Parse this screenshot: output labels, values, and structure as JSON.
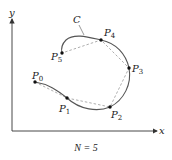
{
  "diagram": {
    "axes": {
      "x_label": "x",
      "y_label": "y",
      "color": "#333333"
    },
    "curve": {
      "label": "C",
      "color": "#555555"
    },
    "polyline": {
      "style": "dashed",
      "color": "#999999"
    },
    "points": [
      {
        "name": "P",
        "sub": "0",
        "x": 35,
        "y": 82
      },
      {
        "name": "P",
        "sub": "1",
        "x": 67,
        "y": 98
      },
      {
        "name": "P",
        "sub": "2",
        "x": 110,
        "y": 107
      },
      {
        "name": "P",
        "sub": "3",
        "x": 129,
        "y": 68
      },
      {
        "name": "P",
        "sub": "4",
        "x": 101,
        "y": 40
      },
      {
        "name": "P",
        "sub": "5",
        "x": 62,
        "y": 53
      }
    ],
    "caption": "N = 5"
  }
}
